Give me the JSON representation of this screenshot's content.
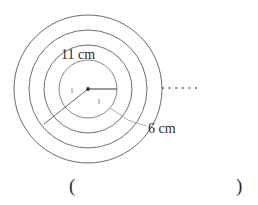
{
  "figure": {
    "type": "concentric-circles-target",
    "center": {
      "x": 88,
      "y": 89
    },
    "circles": [
      {
        "name": "outermost-circle",
        "radius": 74
      },
      {
        "name": "third-circle",
        "radius": 59
      },
      {
        "name": "second-circle",
        "radius": 44
      },
      {
        "name": "innermost-circle",
        "radius": 29
      }
    ],
    "center_dot_radius": 2,
    "radii_lines": [
      {
        "name": "horizontal-radius-line",
        "angle_deg": 0,
        "length": 29
      },
      {
        "name": "diagonal-radius-line",
        "angle_deg": 218,
        "length": 56
      }
    ],
    "tick_marks": [
      {
        "name": "tick-on-diagonal-radius"
      },
      {
        "name": "tick-on-inner-circle"
      }
    ],
    "ellipsis_dots": {
      "name": "continuation-dots",
      "count": 6,
      "start_x": 163,
      "y": 88,
      "spacing": 6.6,
      "dot_radius": 1.1
    },
    "leader_line": {
      "name": "leader-line-6cm",
      "from": {
        "x": 146,
        "y": 126
      },
      "mid": {
        "x": 128,
        "y": 120
      },
      "to": {
        "x": 110,
        "y": 108
      }
    }
  },
  "labels": {
    "outer_diameter": "11 cm",
    "inner_radius": "6 cm"
  },
  "answer_blank": {
    "open_paren": "(",
    "close_paren": ")"
  },
  "colors": {
    "stroke": "#555555",
    "stroke_light": "#8a8a8a",
    "text": "#2b2b2b",
    "background": "#ffffff"
  }
}
